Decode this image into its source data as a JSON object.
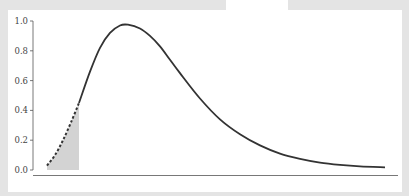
{
  "chart_data": {
    "type": "line",
    "title": "",
    "xlabel": "",
    "ylabel": "",
    "ylim": [
      0,
      1.0
    ],
    "yticks": [
      "0.0",
      "0.2",
      "0.4",
      "0.6",
      "0.8",
      "1.0"
    ],
    "xticks": [],
    "grid": false,
    "legend": null,
    "series": [
      {
        "name": "density curve",
        "style": "solid",
        "color": "#333333",
        "x_px": [
          79,
          90,
          100,
          110,
          120,
          128,
          140,
          150,
          160,
          170,
          180,
          200,
          220,
          240,
          260,
          280,
          300,
          320,
          340,
          360,
          385
        ],
        "values": [
          0.45,
          0.66,
          0.82,
          0.92,
          0.97,
          0.975,
          0.95,
          0.9,
          0.83,
          0.74,
          0.65,
          0.48,
          0.34,
          0.24,
          0.165,
          0.11,
          0.075,
          0.05,
          0.035,
          0.025,
          0.018
        ]
      },
      {
        "name": "lower tail (dashed)",
        "style": "dashed",
        "color": "#333333",
        "x_px": [
          47,
          55,
          63,
          71,
          79
        ],
        "values": [
          0.03,
          0.1,
          0.2,
          0.32,
          0.45
        ]
      }
    ],
    "shaded_region": {
      "description": "shaded area under the dashed lower tail",
      "color": "#d3d3d3",
      "x_px_range": [
        47,
        79
      ]
    }
  },
  "colors": {
    "background": "#e4e4e4",
    "panel": "#ffffff",
    "line": "#333333",
    "axis": "#555555",
    "shade": "#d3d3d3"
  }
}
